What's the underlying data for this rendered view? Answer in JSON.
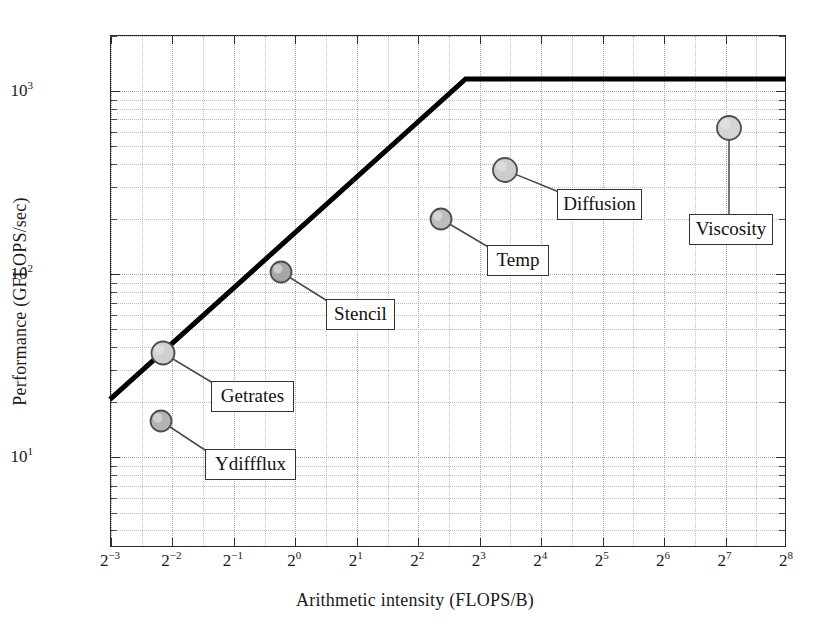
{
  "chart_data": {
    "type": "scatter",
    "title": "",
    "xlabel": "Arithmetic intensity (FLOPS/B)",
    "ylabel": "Performance (GFLOPS/sec)",
    "xscale": "log2",
    "yscale": "log10",
    "xlim": [
      0.125,
      256
    ],
    "ylim": [
      3.2,
      2000
    ],
    "grid": true,
    "legend": "none",
    "x_tick_labels": [
      "2−3",
      "2−2",
      "2−1",
      "2⁰",
      "2¹",
      "2²",
      "2³",
      "2⁴",
      "2⁵",
      "2⁶",
      "2⁷",
      "2⁸"
    ],
    "x_tick_base": 2,
    "x_tick_exponents": [
      -3,
      -2,
      -1,
      0,
      1,
      2,
      3,
      4,
      5,
      6,
      7,
      8
    ],
    "y_tick_labels": [
      "10¹",
      "10²",
      "10³"
    ],
    "y_tick_exponents": [
      1,
      2,
      3
    ],
    "roofline": {
      "name": "roofline",
      "peak_performance": 1150,
      "ridge_point_intensity": 6.9,
      "slope_start": {
        "x": 0.125,
        "y": 20.5
      },
      "knee": {
        "x": 6.9,
        "y": 1150
      },
      "end": {
        "x": 256,
        "y": 1150
      },
      "color": "#000000",
      "linewidth": 5
    },
    "points": [
      {
        "label": "Getrates",
        "x": 0.227,
        "y": 41,
        "x_exp": -2.14,
        "marker_color": "#d0d0d0"
      },
      {
        "label": "Ydiffflux",
        "x": 0.219,
        "y": 18,
        "x_exp": -2.19,
        "marker_color": "#b3b3b3"
      },
      {
        "label": "Stencil",
        "x": 0.853,
        "y": 110,
        "x_exp": -0.23,
        "marker_color": "#a6a6a6"
      },
      {
        "label": "Temp",
        "x": 5.17,
        "y": 208,
        "x_exp": 2.37,
        "marker_color": "#bdbdbd"
      },
      {
        "label": "Diffusion",
        "x": 10.6,
        "y": 390,
        "x_exp": 3.41,
        "marker_color": "#cccccc"
      },
      {
        "label": "Viscosity",
        "x": 133.0,
        "y": 650,
        "x_exp": 7.06,
        "marker_color": "#d4d4d4"
      }
    ]
  },
  "labels": {
    "getrates": "Getrates",
    "ydiffflux": "Ydiffflux",
    "stencil": "Stencil",
    "temp": "Temp",
    "diffusion": "Diffusion",
    "viscosity": "Viscosity"
  },
  "axes": {
    "x_title": "Arithmetic intensity (FLOPS/B)",
    "y_title": "Performance (GFLOPS/sec)",
    "x_ticks": [
      {
        "base": "2",
        "exp": "−3"
      },
      {
        "base": "2",
        "exp": "−2"
      },
      {
        "base": "2",
        "exp": "−1"
      },
      {
        "base": "2",
        "exp": "0"
      },
      {
        "base": "2",
        "exp": "1"
      },
      {
        "base": "2",
        "exp": "2"
      },
      {
        "base": "2",
        "exp": "3"
      },
      {
        "base": "2",
        "exp": "4"
      },
      {
        "base": "2",
        "exp": "5"
      },
      {
        "base": "2",
        "exp": "6"
      },
      {
        "base": "2",
        "exp": "7"
      },
      {
        "base": "2",
        "exp": "8"
      }
    ],
    "y_ticks": [
      {
        "base": "10",
        "exp": "3"
      },
      {
        "base": "10",
        "exp": "2"
      },
      {
        "base": "10",
        "exp": "1"
      }
    ]
  },
  "colors": {
    "frame": "#2b2b2b",
    "grid": "#bdbdbd",
    "roofline": "#000000",
    "leader": "#4a4a4a",
    "callout_border": "#333333",
    "text": "#1a1a1a"
  }
}
